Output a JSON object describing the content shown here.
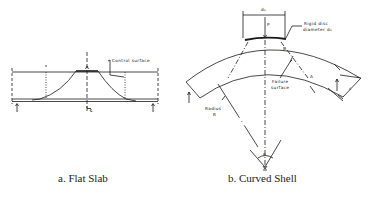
{
  "figure": {
    "panels": [
      {
        "id": "a",
        "caption": "a.  Flat Slab",
        "labels": {
          "control_surface": "Control surface",
          "centerline": "℄"
        }
      },
      {
        "id": "b",
        "caption": "b. Curved Shell",
        "labels": {
          "disc_width": "d₀",
          "load": "P",
          "rigid_disc_line1": "Rigid disc",
          "rigid_disc_line2": "diameter d₀",
          "point_b": "B",
          "point_a": "A",
          "failure_line1": "Failure",
          "failure_line2": "surface",
          "radius_line1": "Radius",
          "radius_line2": "R",
          "thickness": "c",
          "angle": "θ"
        }
      }
    ]
  },
  "colors": {
    "line": "#1a1a1a",
    "background": "#ffffff"
  }
}
